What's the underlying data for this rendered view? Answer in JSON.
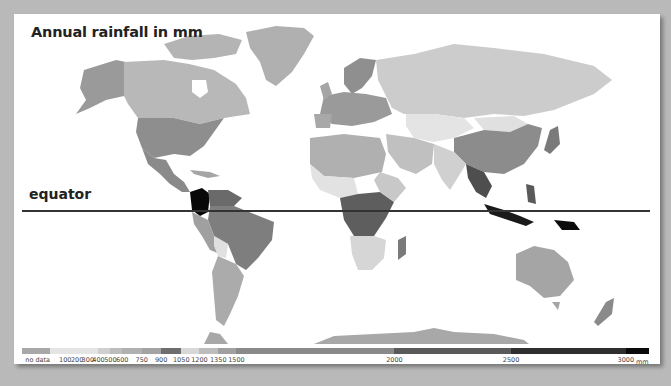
{
  "title": "Annual rainfall in mm",
  "equator_label": "equator",
  "legend": {
    "unit": "mm",
    "no_data_label": "no data",
    "labels": [
      {
        "text": "no data",
        "pos": 0.025
      },
      {
        "text": "100",
        "pos": 0.069
      },
      {
        "text": "200",
        "pos": 0.088
      },
      {
        "text": "300",
        "pos": 0.105
      },
      {
        "text": "400",
        "pos": 0.122
      },
      {
        "text": "500",
        "pos": 0.141
      },
      {
        "text": "600",
        "pos": 0.16
      },
      {
        "text": "750",
        "pos": 0.191
      },
      {
        "text": "900",
        "pos": 0.222
      },
      {
        "text": "1050",
        "pos": 0.254
      },
      {
        "text": "1200",
        "pos": 0.283
      },
      {
        "text": "1350",
        "pos": 0.313
      },
      {
        "text": "1500",
        "pos": 0.342
      },
      {
        "text": "2000",
        "pos": 0.594
      },
      {
        "text": "2500",
        "pos": 0.78
      },
      {
        "text": "3000",
        "pos": 0.963
      }
    ],
    "bins": [
      {
        "from": 0.0,
        "to": 0.045,
        "color": "#a8a8a8"
      },
      {
        "from": 0.045,
        "to": 0.122,
        "color": "#e4e4e4"
      },
      {
        "from": 0.122,
        "to": 0.141,
        "color": "#cfcfcf"
      },
      {
        "from": 0.141,
        "to": 0.16,
        "color": "#bdbdbd"
      },
      {
        "from": 0.16,
        "to": 0.191,
        "color": "#b0b0b0"
      },
      {
        "from": 0.191,
        "to": 0.222,
        "color": "#a3a3a3"
      },
      {
        "from": 0.222,
        "to": 0.254,
        "color": "#6e6e6e"
      },
      {
        "from": 0.254,
        "to": 0.283,
        "color": "#d8d8d8"
      },
      {
        "from": 0.283,
        "to": 0.313,
        "color": "#bdbdbd"
      },
      {
        "from": 0.313,
        "to": 0.342,
        "color": "#a0a0a0"
      },
      {
        "from": 0.342,
        "to": 0.594,
        "color": "#8a8a8a"
      },
      {
        "from": 0.594,
        "to": 0.78,
        "color": "#5a5a5a"
      },
      {
        "from": 0.78,
        "to": 0.963,
        "color": "#2e2e2e"
      },
      {
        "from": 0.963,
        "to": 1.0,
        "color": "#0a0a0a"
      }
    ]
  },
  "regions": [
    {
      "name": "Canada",
      "color": "#b8b8b8"
    },
    {
      "name": "Alaska",
      "color": "#9a9a9a"
    },
    {
      "name": "USA",
      "color": "#8e8e8e"
    },
    {
      "name": "Mexico",
      "color": "#8a8a8a"
    },
    {
      "name": "Greenland",
      "color": "#b0b0b0"
    },
    {
      "name": "Colombia",
      "color": "#080808"
    },
    {
      "name": "Brazil",
      "color": "#7e7e7e"
    },
    {
      "name": "Argentina",
      "color": "#ababab"
    },
    {
      "name": "Russia",
      "color": "#cccccc"
    },
    {
      "name": "China",
      "color": "#8c8c8c"
    },
    {
      "name": "Central Asia",
      "color": "#e4e4e4"
    },
    {
      "name": "India",
      "color": "#d0d0d0"
    },
    {
      "name": "Africa North",
      "color": "#b0b0b0"
    },
    {
      "name": "Central Africa",
      "color": "#5e5e5e"
    },
    {
      "name": "Southern Africa",
      "color": "#d6d6d6"
    },
    {
      "name": "Australia",
      "color": "#a5a5a5"
    },
    {
      "name": "Indonesia",
      "color": "#1a1a1a"
    },
    {
      "name": "Antarctica",
      "color": "#a8a8a8"
    }
  ]
}
